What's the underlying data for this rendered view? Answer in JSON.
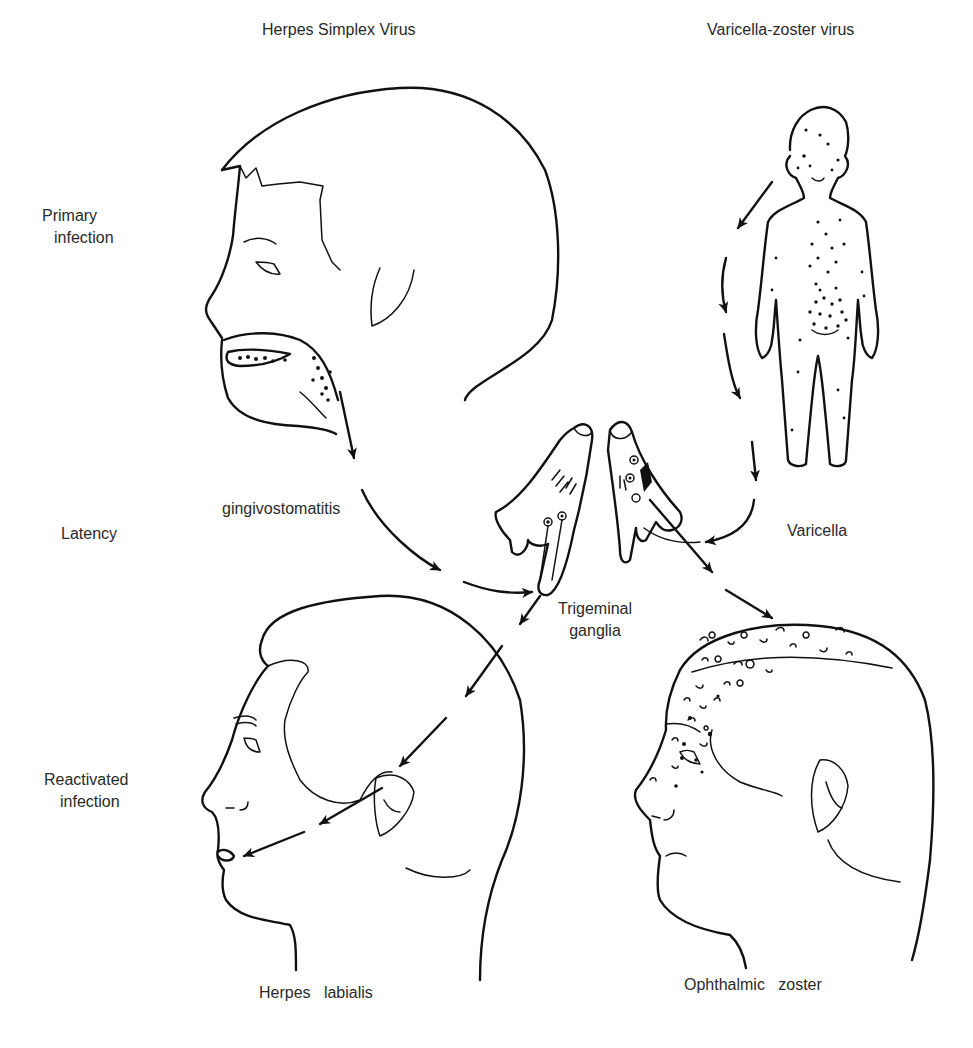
{
  "columns": {
    "hsv_title": "Herpes Simplex Virus",
    "vzv_title": "Varicella-zoster virus"
  },
  "stages": {
    "primary": [
      "Primary",
      "infection"
    ],
    "latency": "Latency",
    "reactivated": [
      "Reactivated",
      "infection"
    ]
  },
  "annotations": {
    "gingivostomatitis": "gingivostomatitis",
    "varicella": "Varicella",
    "trigeminal": [
      "Trigeminal",
      "ganglia"
    ],
    "herpes_labialis": "Herpes   labialis",
    "ophthalmic_zoster": "Ophthalmic   zoster"
  },
  "figures": {
    "hsv_primary": "child-head-profile-with-oral-lesions",
    "vzv_primary": "child-full-body-with-vesicles",
    "ganglia_left": "trigeminal-ganglion-hsv",
    "ganglia_right": "trigeminal-ganglion-vzv",
    "hsv_reactivated": "adult-head-profile-lip-lesion",
    "vzv_reactivated": "adult-head-profile-forehead-vesicles"
  },
  "colors": {
    "ink": "#111111",
    "text": "#2a2a2a",
    "background": "#ffffff"
  }
}
